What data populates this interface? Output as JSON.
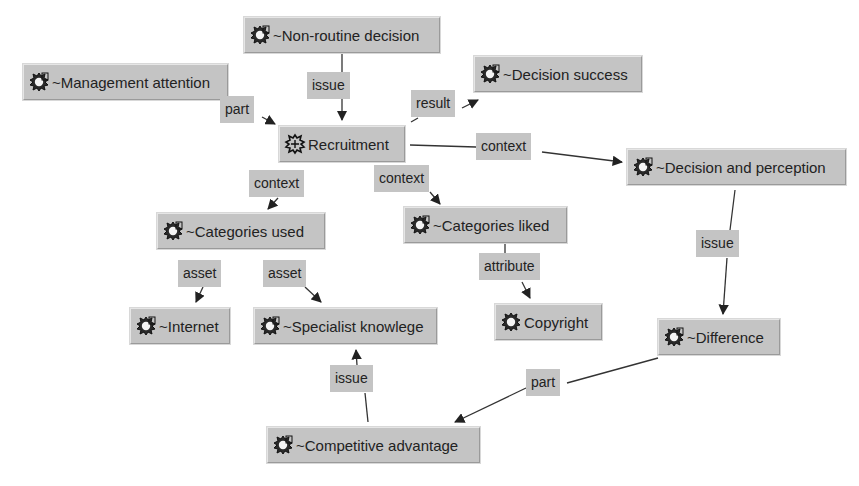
{
  "diagram": {
    "colors": {
      "node_fill": "#c4c4c4",
      "edge": "#222222",
      "background": "#ffffff"
    },
    "nodes": [
      {
        "id": "non_routine_decision",
        "label": "~Non-routine decision",
        "icon": "hollow-topic-icon",
        "x": 244,
        "y": 17,
        "w": 196
      },
      {
        "id": "management_attention",
        "label": "~Management attention",
        "icon": "hollow-topic-icon",
        "x": 23,
        "y": 64,
        "w": 205
      },
      {
        "id": "decision_success",
        "label": "~Decision success",
        "icon": "hollow-topic-icon",
        "x": 474,
        "y": 56,
        "w": 168
      },
      {
        "id": "recruitment",
        "label": "Recruitment",
        "icon": "topic-icon",
        "x": 279,
        "y": 126,
        "w": 126
      },
      {
        "id": "decision_and_perception",
        "label": "~Decision and perception",
        "icon": "hollow-topic-icon",
        "x": 627,
        "y": 149,
        "w": 219
      },
      {
        "id": "categories_used",
        "label": "~Categories used",
        "icon": "hollow-topic-icon",
        "x": 157,
        "y": 213,
        "w": 168
      },
      {
        "id": "categories_liked",
        "label": "~Categories liked",
        "icon": "hollow-topic-icon",
        "x": 404,
        "y": 207,
        "w": 163
      },
      {
        "id": "internet",
        "label": "~Internet",
        "icon": "hollow-topic-icon",
        "x": 130,
        "y": 308,
        "w": 100
      },
      {
        "id": "specialist_knowlege",
        "label": "~Specialist knowlege",
        "icon": "hollow-topic-icon",
        "x": 254,
        "y": 308,
        "w": 183
      },
      {
        "id": "copyright",
        "label": "Copyright",
        "icon": "occurrence-icon",
        "x": 495,
        "y": 304,
        "w": 107
      },
      {
        "id": "difference",
        "label": "~Difference",
        "icon": "hollow-topic-icon",
        "x": 658,
        "y": 319,
        "w": 122
      },
      {
        "id": "competitive_advantage",
        "label": "~Competitive advantage",
        "icon": "hollow-topic-icon",
        "x": 267,
        "y": 427,
        "w": 213
      }
    ],
    "edges": [
      {
        "from": "non_routine_decision",
        "to": "recruitment",
        "label": "issue",
        "lx": 307,
        "ly": 72,
        "points": [
          [
            342,
            53
          ],
          [
            342,
            72
          ]
        ],
        "points2": [
          [
            342,
            99
          ],
          [
            342,
            120
          ]
        ]
      },
      {
        "from": "management_attention",
        "to": "recruitment",
        "label": "part",
        "lx": 220,
        "ly": 96,
        "points": [
          [
            262,
            117
          ],
          [
            275,
            124
          ]
        ]
      },
      {
        "from": "recruitment",
        "to": "decision_success",
        "label": "result",
        "lx": 411,
        "ly": 90,
        "points": [
          [
            411,
            122
          ],
          [
            418,
            118
          ]
        ],
        "points2": [
          [
            462,
            108
          ],
          [
            478,
            100
          ]
        ]
      },
      {
        "from": "recruitment",
        "to": "decision_and_perception",
        "label": "context",
        "lx": 476,
        "ly": 133,
        "points": [
          [
            410,
            145
          ],
          [
            476,
            147
          ]
        ],
        "points2": [
          [
            542,
            152
          ],
          [
            622,
            162
          ]
        ]
      },
      {
        "from": "recruitment",
        "to": "categories_used",
        "label": "context",
        "lx": 249,
        "ly": 170,
        "points": [
          [
            278,
            198
          ],
          [
            268,
            209
          ]
        ]
      },
      {
        "from": "recruitment",
        "to": "categories_liked",
        "label": "context",
        "lx": 374,
        "ly": 165,
        "points": [
          [
            430,
            192
          ],
          [
            440,
            204
          ]
        ]
      },
      {
        "from": "categories_used",
        "to": "internet",
        "label": "asset",
        "lx": 178,
        "ly": 260,
        "points": [
          [
            203,
            287
          ],
          [
            196,
            302
          ]
        ]
      },
      {
        "from": "categories_used",
        "to": "specialist_knowlege",
        "label": "asset",
        "lx": 263,
        "ly": 260,
        "points": [
          [
            305,
            287
          ],
          [
            321,
            302
          ]
        ]
      },
      {
        "from": "categories_liked",
        "to": "copyright",
        "label": "attribute",
        "lx": 479,
        "ly": 253,
        "points": [
          [
            505,
            244
          ],
          [
            505,
            253
          ]
        ],
        "points2": [
          [
            522,
            282
          ],
          [
            530,
            298
          ]
        ]
      },
      {
        "from": "decision_and_perception",
        "to": "difference",
        "label": "issue",
        "lx": 696,
        "ly": 230,
        "points": [
          [
            735,
            190
          ],
          [
            730,
            230
          ]
        ],
        "points2": [
          [
            727,
            258
          ],
          [
            723,
            314
          ]
        ]
      },
      {
        "from": "difference",
        "to": "competitive_advantage",
        "label": "part",
        "lx": 526,
        "ly": 369,
        "points": [
          [
            658,
            358
          ],
          [
            567,
            383
          ]
        ],
        "points2": [
          [
            526,
            388
          ],
          [
            455,
            422
          ]
        ]
      },
      {
        "from": "competitive_advantage",
        "to": "specialist_knowlege",
        "label": "issue",
        "lx": 330,
        "ly": 365,
        "points": [
          [
            368,
            422
          ],
          [
            365,
            393
          ]
        ],
        "points2": [
          [
            357,
            365
          ],
          [
            356,
            350
          ]
        ]
      }
    ]
  }
}
